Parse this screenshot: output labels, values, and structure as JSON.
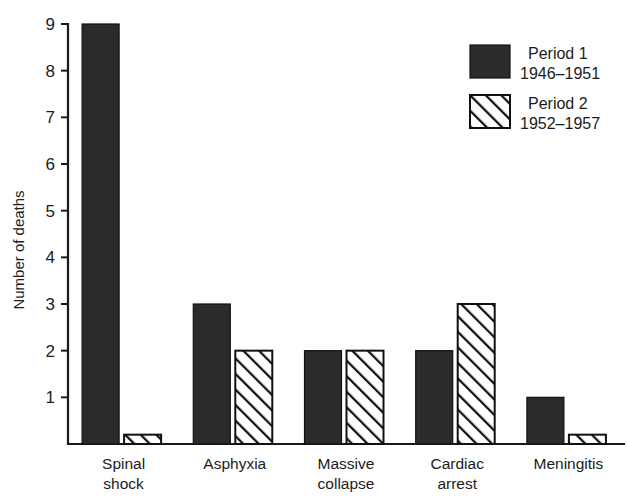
{
  "chart_data": {
    "type": "bar",
    "title": "",
    "xlabel": "",
    "ylabel": "Number of deaths",
    "ylim": [
      0,
      9.2
    ],
    "yticks": [
      1,
      2,
      3,
      4,
      5,
      6,
      7,
      8,
      9
    ],
    "grid": false,
    "legend_position": "top-right",
    "categories": [
      "Spinal shock",
      "Asphyxia",
      "Massive collapse",
      "Cardiac arrest",
      "Meningitis"
    ],
    "category_lines": [
      [
        "Spinal",
        "shock"
      ],
      [
        "Asphyxia",
        ""
      ],
      [
        "Massive",
        "collapse"
      ],
      [
        "Cardiac",
        "arrest"
      ],
      [
        "Meningitis",
        ""
      ]
    ],
    "series": [
      {
        "name": "Period 1",
        "range": "1946–1951",
        "fill": "solid",
        "color": "#2b2b2b",
        "values": [
          9,
          3,
          2,
          2,
          1
        ]
      },
      {
        "name": "Period 2",
        "range": "1952–1957",
        "fill": "hatch",
        "color": "#ffffff",
        "values": [
          0.2,
          2,
          2,
          3,
          0.2
        ]
      }
    ]
  },
  "axis": {
    "y_title": "Number of deaths",
    "tick_labels": [
      "1",
      "2",
      "3",
      "4",
      "5",
      "6",
      "7",
      "8",
      "9"
    ]
  },
  "legend": {
    "entries": [
      {
        "label": "Period 1",
        "sublabel": "1946–1951",
        "swatch": "solid-black-swatch"
      },
      {
        "label": "Period 2",
        "sublabel": "1952–1957",
        "swatch": "diagonal-hatch-swatch"
      }
    ]
  },
  "colors": {
    "ink": "#1a1a1a",
    "bar_solid": "#2b2b2b",
    "background": "#ffffff"
  }
}
